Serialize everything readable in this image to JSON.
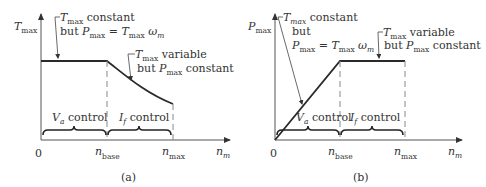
{
  "figure": {
    "panels": [
      {
        "id": "a",
        "caption": "(a)",
        "y_axis_label": {
          "main": "T",
          "sub": "max"
        },
        "x_axis_label": {
          "main": "n",
          "sub": "m"
        },
        "origin_label": "0",
        "tick_base": {
          "main": "n",
          "sub": "base"
        },
        "tick_max": {
          "main": "n",
          "sub": "max"
        },
        "annotation_1": {
          "line1_var": "T",
          "line1_sub": "max",
          "line1_text": " constant",
          "line2_text": "but ",
          "line2_var": "P",
          "line2_sub": "max",
          "line2_eq": " = ",
          "line2_var2": "T",
          "line2_sub2": "max",
          "line2_omega": " ω",
          "line2_omega_sub": "m"
        },
        "annotation_2": {
          "line1_var": "T",
          "line1_sub": "max",
          "line1_text": " variable",
          "line2_text": "but ",
          "line2_var": "P",
          "line2_sub": "max",
          "line2_text2": " constant"
        },
        "region_1": {
          "var": "V",
          "sub": "a",
          "text": " control"
        },
        "region_2": {
          "var": "I",
          "sub": "f",
          "text": " control"
        }
      },
      {
        "id": "b",
        "caption": "(b)",
        "y_axis_label": {
          "main": "P",
          "sub": "max"
        },
        "x_axis_label": {
          "main": "n",
          "sub": "m"
        },
        "origin_label": "0",
        "tick_base": {
          "main": "n",
          "sub": "base"
        },
        "tick_max": {
          "main": "n",
          "sub": "max"
        },
        "annotation_1": {
          "line1_var": "T",
          "line1_sub": "max",
          "line1_text": " constant",
          "line2_text": "but",
          "line3_var": "P",
          "line3_sub": "max",
          "line3_eq": " = ",
          "line3_var2": "T",
          "line3_sub2": "max",
          "line3_omega": " ω",
          "line3_omega_sub": "m"
        },
        "annotation_2": {
          "line1_var": "T",
          "line1_sub": "max",
          "line1_text": " variable",
          "line2_text": "but ",
          "line2_var": "P",
          "line2_sub": "max",
          "line2_text2": " constant"
        },
        "region_1": {
          "var": "V",
          "sub": "a",
          "text": " control"
        },
        "region_2": {
          "var": "I",
          "sub": "f",
          "text": " control"
        }
      }
    ],
    "colors": {
      "line": "#2a2a2a",
      "text": "#333333",
      "dashed": "#888888"
    }
  }
}
